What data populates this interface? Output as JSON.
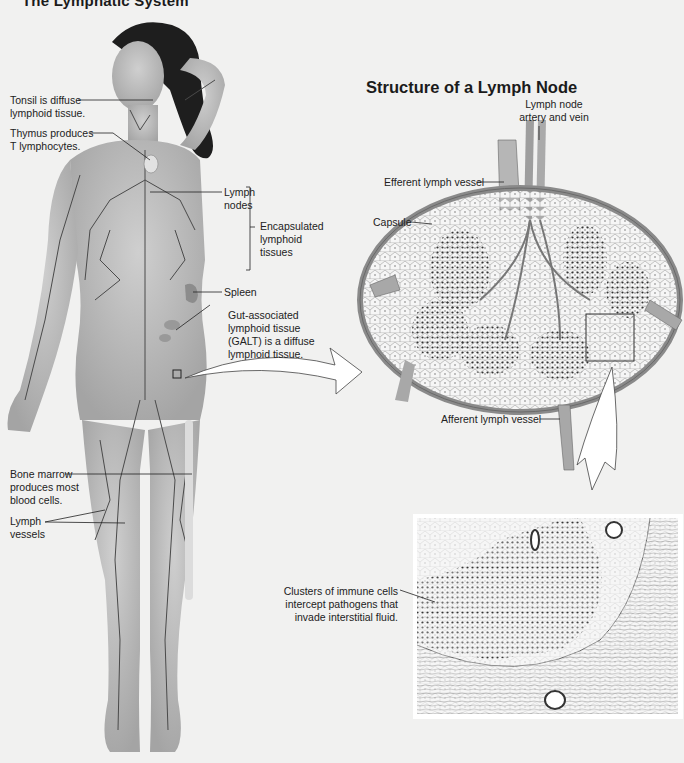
{
  "figure": {
    "title": "The Lymphatic System",
    "subtitle": "Structure of a Lymph Node"
  },
  "body_labels": {
    "tonsil": "Tonsil is diffuse\nlymphoid tissue.",
    "thymus": "Thymus produces\nT lymphocytes.",
    "lymph_nodes": "Lymph\nnodes",
    "encapsulated": "Encapsulated\nlymphoid\ntissues",
    "spleen": "Spleen",
    "galt": "Gut-associated\nlymphoid tissue\n(GALT) is a diffuse\nlymphoid tissue.",
    "bone_marrow": "Bone marrow\nproduces most\nblood cells.",
    "lymph_vessels": "Lymph\nvessels"
  },
  "node_labels": {
    "artery_vein": "Lymph node\nartery and vein",
    "efferent": "Efferent lymph vessel",
    "capsule": "Capsule",
    "afferent": "Afferent lymph vessel",
    "clusters": "Clusters of immune cells\nintercept pathogens that\ninvade interstitial fluid."
  },
  "colors": {
    "background": "#f1f1f0",
    "skin": "#bdbdbd",
    "skin_shadow": "#9a9a9a",
    "vessel": "#4a4a4a",
    "hair": "#1e1e1e",
    "node_tissue": "#e6e6e6",
    "capsule": "#a8a8a8"
  }
}
